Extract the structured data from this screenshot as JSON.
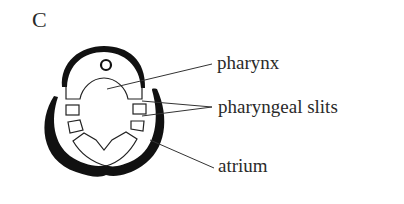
{
  "figure": {
    "panel_letter": "C",
    "labels": {
      "pharynx": "pharynx",
      "pharyngeal_slits": "pharyngeal slits",
      "atrium": "atrium"
    },
    "colors": {
      "ink": "#111111",
      "text": "#2a2a2a",
      "background": "#ffffff"
    }
  }
}
